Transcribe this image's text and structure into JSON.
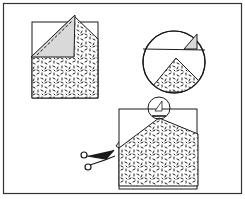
{
  "diagram": {
    "colors": {
      "stroke": "#1a1a1a",
      "fold_fill": "#d9d9d9",
      "paper": "#ffffff",
      "frame": "#333333"
    },
    "steps": [
      {
        "id": "fold",
        "label": "Folded corner with dashed fold line"
      },
      {
        "id": "detail",
        "label": "Magnified circular detail of fold"
      },
      {
        "id": "cut",
        "label": "Scissors cutting along fold edge"
      }
    ],
    "icons": [
      "scissors-icon",
      "magnify-circle-icon"
    ]
  }
}
